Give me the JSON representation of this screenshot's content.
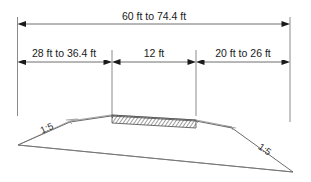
{
  "drawing": {
    "title": "Speed hump cross-section with dimensions",
    "dimensions": {
      "overall": {
        "label": "60 ft to 74.4 ft",
        "name": "overall-dimension"
      },
      "segments": [
        {
          "label": "28 ft to 36.4 ft",
          "name": "left-approach-dimension"
        },
        {
          "label": "12 ft",
          "name": "flat-top-dimension"
        },
        {
          "label": "20 ft to 26 ft",
          "name": "right-approach-dimension"
        }
      ]
    },
    "slopes": [
      {
        "label": "1:5",
        "name": "left-slope-label"
      },
      {
        "label": "1:5",
        "name": "right-slope-label"
      }
    ],
    "colors": {
      "line": "#5a5a5a",
      "dimension_line": "#6e6e6e",
      "extension_line": "#8a8a8a",
      "text": "#1a1a1a",
      "background": "#ffffff",
      "hatch": "#4a4a4a"
    }
  }
}
